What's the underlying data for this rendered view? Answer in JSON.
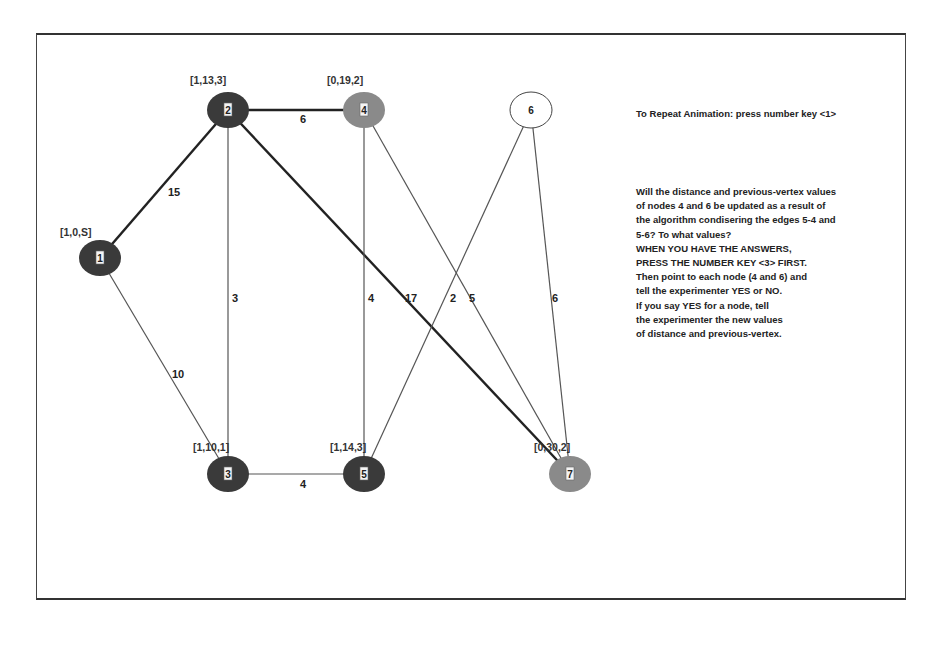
{
  "colors": {
    "visited_node": "#3a3a3a",
    "candidate_node": "#8a8a8a",
    "unvisited_node": "#ffffff",
    "thick_edge": "#222222",
    "thin_edge": "#555555"
  },
  "nodes": [
    {
      "id": "1",
      "tag": "[1,0,S]",
      "state": "visited"
    },
    {
      "id": "2",
      "tag": "[1,13,3]",
      "state": "visited"
    },
    {
      "id": "3",
      "tag": "[1,10,1]",
      "state": "visited"
    },
    {
      "id": "4",
      "tag": "[0,19,2]",
      "state": "candidate"
    },
    {
      "id": "5",
      "tag": "[1,14,3]",
      "state": "visited"
    },
    {
      "id": "6",
      "tag": "",
      "state": "unvisited"
    },
    {
      "id": "7",
      "tag": "[0,30,2]",
      "state": "candidate"
    }
  ],
  "edges": [
    {
      "from": "1",
      "to": "2",
      "weight": "15",
      "highlight": true
    },
    {
      "from": "2",
      "to": "4",
      "weight": "6",
      "highlight": true
    },
    {
      "from": "1",
      "to": "3",
      "weight": "10",
      "highlight": false
    },
    {
      "from": "2",
      "to": "3",
      "weight": "3",
      "highlight": false
    },
    {
      "from": "2",
      "to": "7",
      "weight": "17",
      "highlight": true
    },
    {
      "from": "4",
      "to": "5",
      "weight": "4",
      "highlight": false
    },
    {
      "from": "4",
      "to": "7",
      "weight": "5",
      "highlight": false
    },
    {
      "from": "5",
      "to": "6",
      "weight": "2",
      "highlight": false
    },
    {
      "from": "3",
      "to": "5",
      "weight": "4",
      "highlight": false
    },
    {
      "from": "6",
      "to": "7",
      "weight": "6",
      "highlight": false
    }
  ],
  "panel": {
    "repeat_note": "To Repeat Animation: press number key <1>",
    "question_lines": [
      "Will the distance and previous-vertex values",
      "of nodes 4 and 6 be updated as a result of",
      "the algorithm condisering the edges 5-4 and",
      "5-6? To what values?",
      "WHEN YOU HAVE THE ANSWERS,",
      "PRESS THE NUMBER KEY <3> FIRST.",
      "Then point to each node (4 and 6) and",
      "tell the experimenter YES or NO.",
      "If you say YES for a node, tell",
      "the experimenter the new values",
      "of distance and previous-vertex."
    ]
  }
}
